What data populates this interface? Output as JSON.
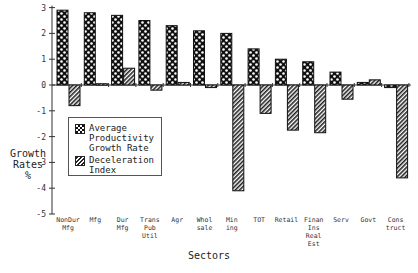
{
  "chart_data": {
    "type": "bar",
    "title": "",
    "xlabel": "Sectors",
    "ylabel": "Growth Rates %",
    "ylim": [
      -5,
      3
    ],
    "yticks": [
      3,
      2,
      1,
      0,
      -1,
      -2,
      -3,
      -4,
      -5
    ],
    "grid": false,
    "legend_position": "inside-left",
    "categories": [
      "NonDur Mfg",
      "Mfg",
      "Dur Mfg",
      "Trans Pub Util",
      "Agr",
      "Whol sale",
      "Min ing",
      "TOT",
      "Retail",
      "Finan Ins Real Est",
      "Serv",
      "Govt",
      "Cons truct"
    ],
    "series": [
      {
        "name": "Average Productivity Growth Rate",
        "pattern": "checker",
        "values": [
          2.9,
          2.8,
          2.7,
          2.5,
          2.3,
          2.1,
          2.0,
          1.4,
          1.0,
          0.9,
          0.5,
          0.1,
          -0.1
        ]
      },
      {
        "name": "Deceleration Index",
        "pattern": "hatch",
        "values": [
          -0.8,
          0.05,
          0.65,
          -0.2,
          0.1,
          -0.1,
          -4.1,
          -1.1,
          -1.75,
          -1.85,
          -0.55,
          0.2,
          -3.6
        ]
      }
    ]
  },
  "labels": {
    "y_title_1": "Growth",
    "y_title_2": "Rates",
    "y_title_3": "%",
    "x_title": "Sectors",
    "legend_1a": "Average",
    "legend_1b": "Productivity",
    "legend_1c": "Growth Rate",
    "legend_2a": "Deceleration",
    "legend_2b": "Index"
  }
}
